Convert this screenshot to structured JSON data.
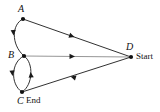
{
  "diagram": {
    "type": "directed-graph",
    "colors": {
      "stroke": "#1a1a1a",
      "stroke_light": "#8a8a8a",
      "vertex_fill": "#111111",
      "text": "#111111",
      "background": "#ffffff"
    },
    "vertices": [
      {
        "id": "A",
        "label": "A",
        "x": 23,
        "y": 19,
        "role": ""
      },
      {
        "id": "B",
        "label": "B",
        "x": 24,
        "y": 56,
        "role": ""
      },
      {
        "id": "C",
        "label": "C",
        "x": 22,
        "y": 92,
        "role": "End"
      },
      {
        "id": "D",
        "label": "D",
        "x": 131,
        "y": 57,
        "role": "Start"
      }
    ],
    "role_labels": {
      "start": "Start",
      "end": "End"
    },
    "edges": [
      {
        "id": "A-D",
        "from": "A",
        "to": "D",
        "shape": "straight",
        "direction": "A to D",
        "arrow_at_x": 72,
        "arrow_at_y": 36,
        "color": "#1a1a1a"
      },
      {
        "id": "A-B",
        "from": "A",
        "to": "B",
        "shape": "curve-left",
        "direction": "A to B",
        "arrow_at_x": 14,
        "arrow_at_y": 33,
        "color": "#1a1a1a"
      },
      {
        "id": "B-D",
        "from": "B",
        "to": "D",
        "shape": "straight",
        "direction": "B to D",
        "arrow_at_x": 72,
        "arrow_at_y": 56,
        "color": "#8a8a8a"
      },
      {
        "id": "B-C",
        "from": "B",
        "to": "C",
        "shape": "curve-left",
        "direction": "B to C",
        "arrow_at_x": 13,
        "arrow_at_y": 74,
        "color": "#1a1a1a"
      },
      {
        "id": "C-B",
        "from": "C",
        "to": "B",
        "shape": "curve-right",
        "direction": "C to B",
        "arrow_at_x": 30,
        "arrow_at_y": 74,
        "color": "#1a1a1a"
      },
      {
        "id": "D-C",
        "from": "D",
        "to": "C",
        "shape": "straight",
        "direction": "D to C",
        "arrow_at_x": 73,
        "arrow_at_y": 77,
        "color": "#1a1a1a"
      }
    ]
  }
}
